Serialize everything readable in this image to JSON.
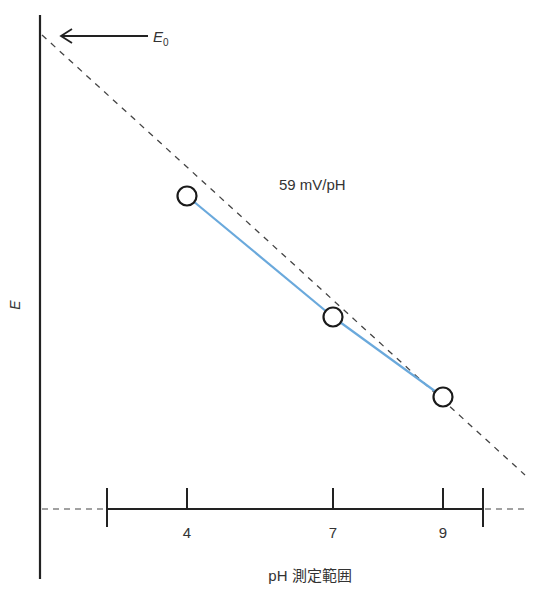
{
  "chart_data": {
    "type": "line",
    "title": "",
    "xlabel": "pH 測定範囲",
    "ylabel": "E",
    "e0_label": "E",
    "e0_subscript": "0",
    "slope_label": "59 mV/pH",
    "x_ticks": [
      4,
      7,
      9
    ],
    "x_tick_labels": [
      "4",
      "7",
      "9"
    ],
    "series": [
      {
        "name": "measured",
        "x": [
          4,
          7,
          9
        ],
        "color": "#6aa9dc"
      },
      {
        "name": "theoretical-nernst",
        "style": "dashed",
        "color": "#444444"
      }
    ]
  }
}
